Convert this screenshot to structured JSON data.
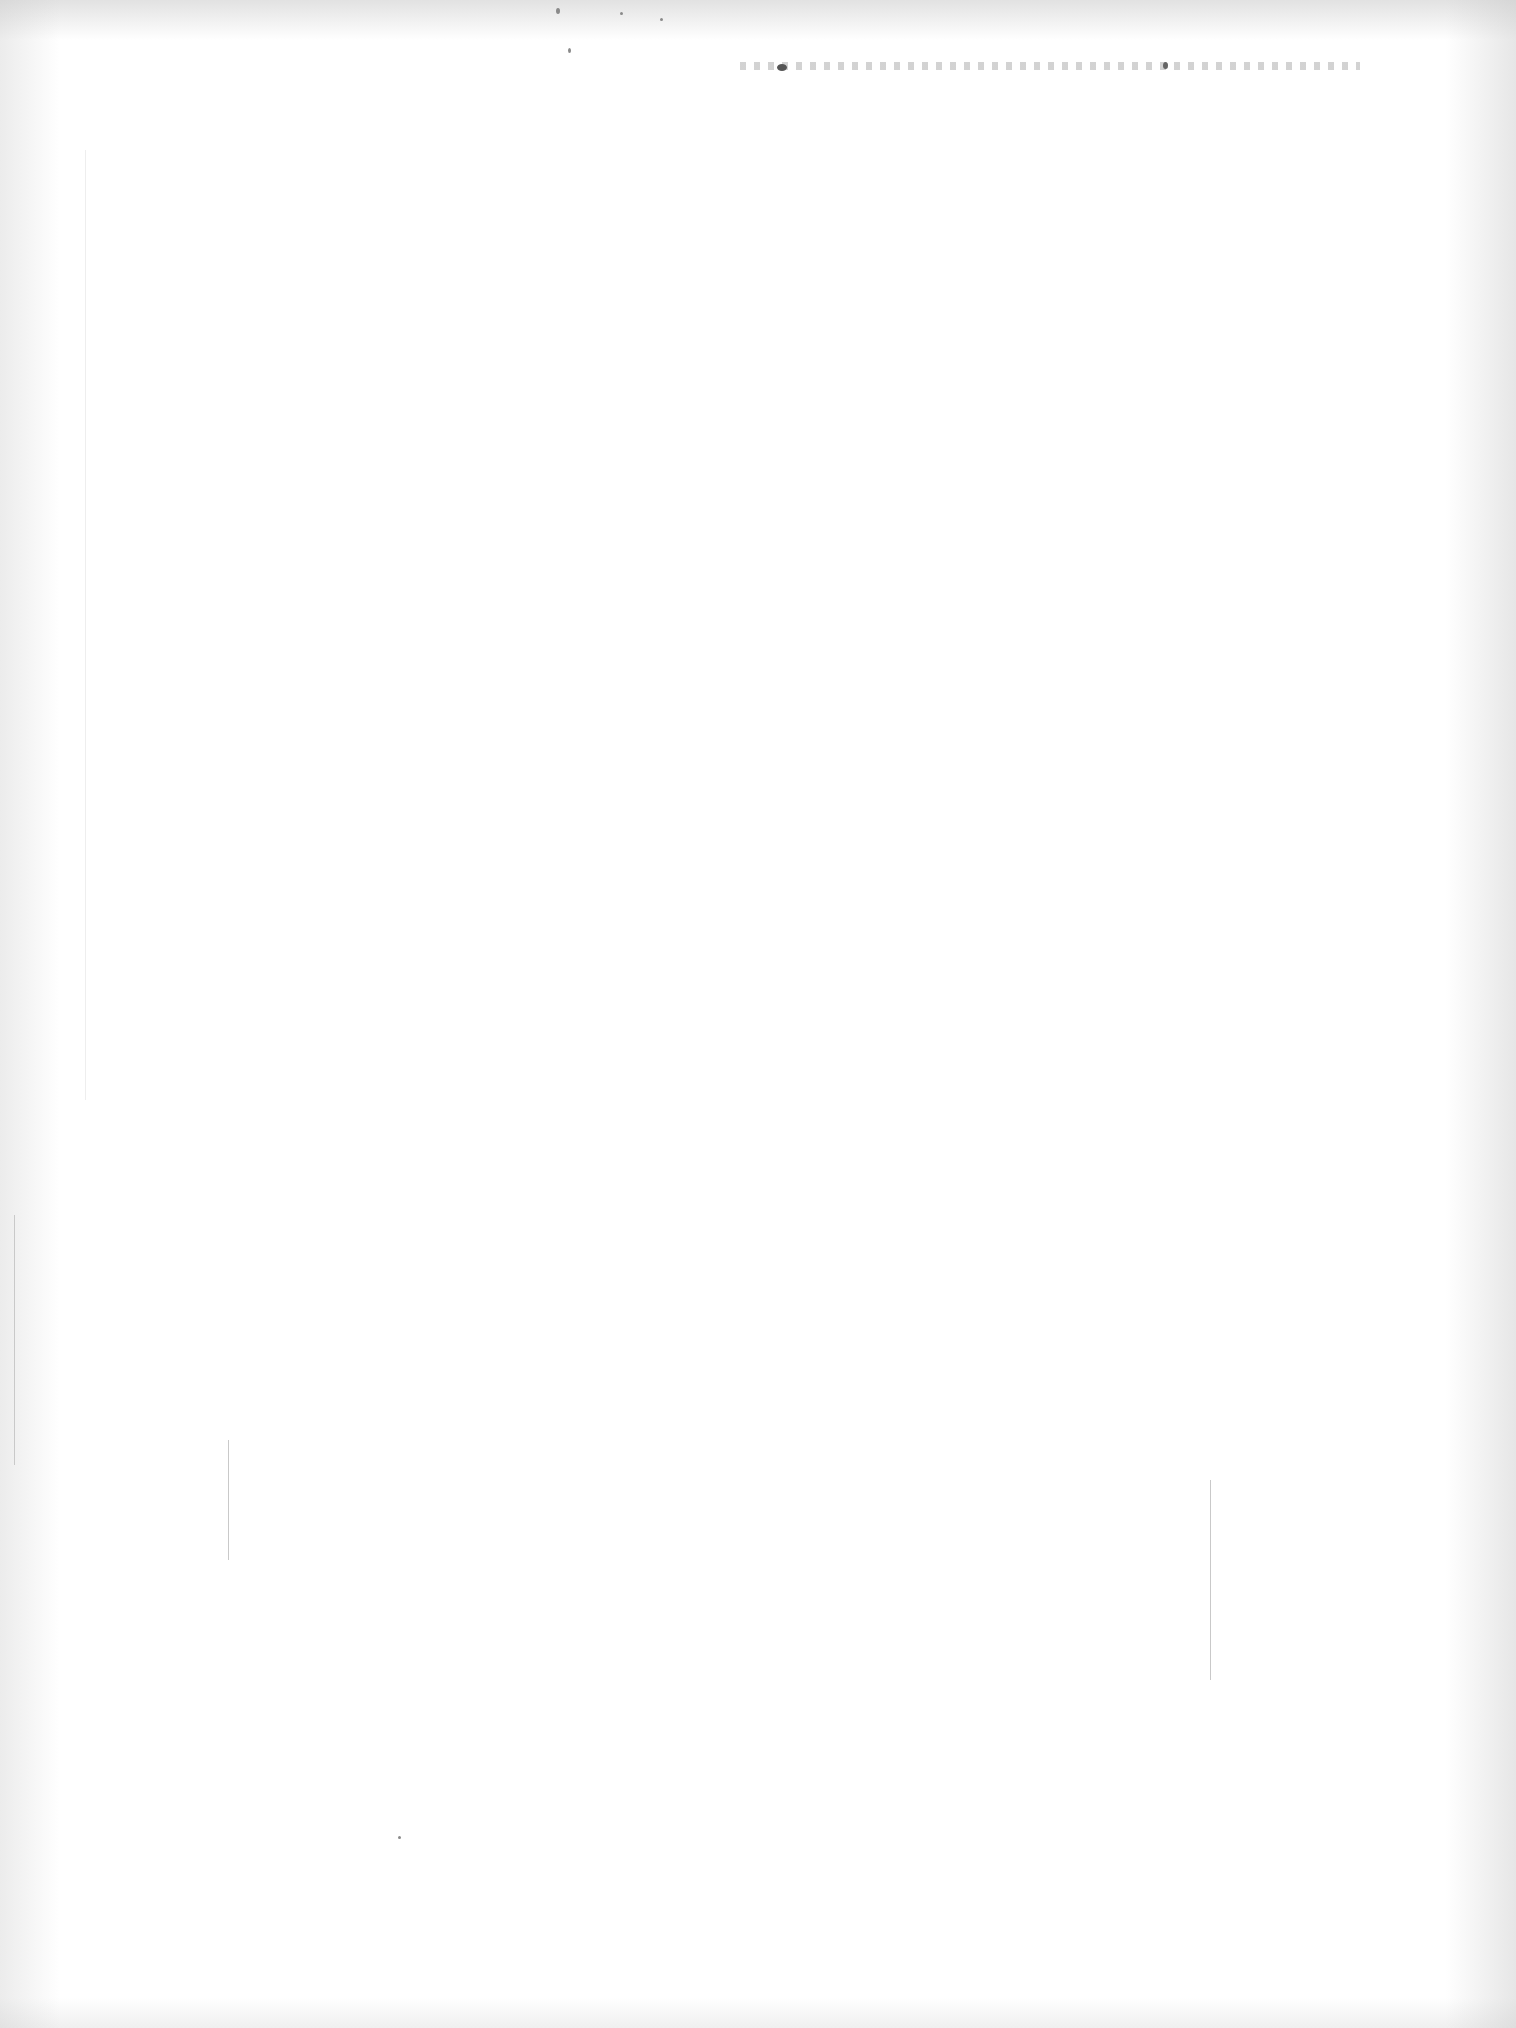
{
  "page": {
    "type": "blank scanned page",
    "text": ""
  }
}
